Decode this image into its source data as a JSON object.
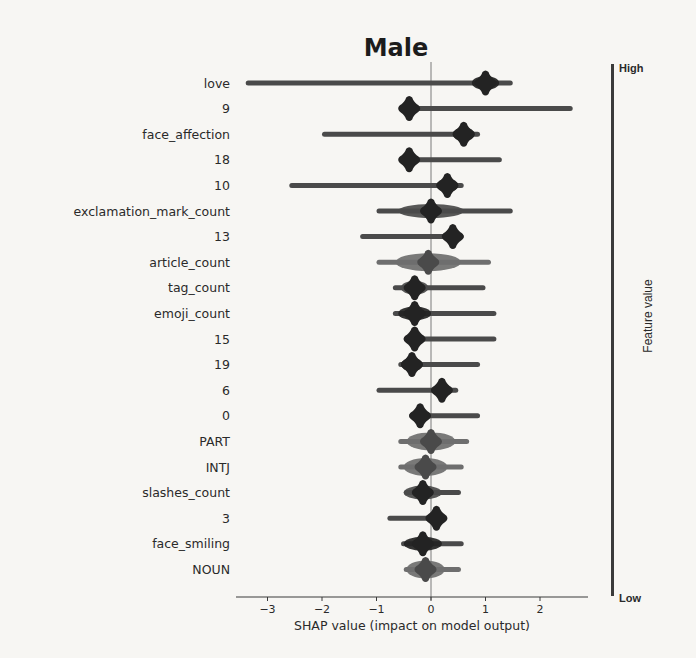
{
  "chart_data": {
    "type": "scatter",
    "subtype": "shap_beeswarm_summary",
    "title": "Male",
    "xlabel": "SHAP value (impact on model output)",
    "ylabel": "",
    "xlim": [
      -3.6,
      2.9
    ],
    "xticks": [
      -3,
      -2,
      -1,
      0,
      1,
      2
    ],
    "xtick_labels": [
      "−3",
      "−2",
      "−1",
      "0",
      "1",
      "2"
    ],
    "grid": false,
    "zero_line": true,
    "colorbar": {
      "title": "Feature value",
      "high_label": "High",
      "low_label": "Low",
      "position": "right"
    },
    "features": [
      {
        "name": "love",
        "min": -3.4,
        "max": 1.5,
        "center": 1.0,
        "spread": 0.25,
        "tone": "dark",
        "tail": "left"
      },
      {
        "name": "9",
        "min": -0.5,
        "max": 2.6,
        "center": -0.4,
        "spread": 0.15,
        "tone": "dark",
        "tail": "right"
      },
      {
        "name": "face_affection",
        "min": -2.0,
        "max": 0.9,
        "center": 0.6,
        "spread": 0.2,
        "tone": "dark",
        "tail": "left"
      },
      {
        "name": "18",
        "min": -0.5,
        "max": 1.3,
        "center": -0.4,
        "spread": 0.15,
        "tone": "dark",
        "tail": "right"
      },
      {
        "name": "10",
        "min": -2.6,
        "max": 0.6,
        "center": 0.3,
        "spread": 0.2,
        "tone": "dark",
        "tail": "left"
      },
      {
        "name": "exclamation_mark_count",
        "min": -1.0,
        "max": 1.5,
        "center": 0.0,
        "spread": 0.6,
        "tone": "mixed",
        "tail": "both"
      },
      {
        "name": "13",
        "min": -1.3,
        "max": 0.6,
        "center": 0.4,
        "spread": 0.12,
        "tone": "dark",
        "tail": "left"
      },
      {
        "name": "article_count",
        "min": -1.0,
        "max": 1.1,
        "center": -0.05,
        "spread": 0.6,
        "tone": "grey",
        "tail": "both"
      },
      {
        "name": "tag_count",
        "min": -0.7,
        "max": 1.0,
        "center": -0.3,
        "spread": 0.25,
        "tone": "mixed",
        "tail": "right"
      },
      {
        "name": "emoji_count",
        "min": -0.7,
        "max": 1.2,
        "center": -0.3,
        "spread": 0.3,
        "tone": "dark",
        "tail": "right"
      },
      {
        "name": "15",
        "min": -0.5,
        "max": 1.2,
        "center": -0.3,
        "spread": 0.12,
        "tone": "dark",
        "tail": "right"
      },
      {
        "name": "19",
        "min": -0.6,
        "max": 0.9,
        "center": -0.35,
        "spread": 0.2,
        "tone": "dark",
        "tail": "right"
      },
      {
        "name": "6",
        "min": -1.0,
        "max": 0.5,
        "center": 0.2,
        "spread": 0.15,
        "tone": "dark",
        "tail": "left"
      },
      {
        "name": "0",
        "min": -0.4,
        "max": 0.9,
        "center": -0.2,
        "spread": 0.1,
        "tone": "dark",
        "tail": "right"
      },
      {
        "name": "PART",
        "min": -0.6,
        "max": 0.7,
        "center": 0.0,
        "spread": 0.45,
        "tone": "grey",
        "tail": "both"
      },
      {
        "name": "INTJ",
        "min": -0.6,
        "max": 0.6,
        "center": -0.1,
        "spread": 0.4,
        "tone": "grey",
        "tail": "both"
      },
      {
        "name": "slashes_count",
        "min": -0.5,
        "max": 0.55,
        "center": -0.15,
        "spread": 0.35,
        "tone": "mixed",
        "tail": "both"
      },
      {
        "name": "3",
        "min": -0.8,
        "max": 0.25,
        "center": 0.1,
        "spread": 0.08,
        "tone": "dark",
        "tail": "left"
      },
      {
        "name": "face_smiling",
        "min": -0.55,
        "max": 0.6,
        "center": -0.15,
        "spread": 0.35,
        "tone": "dark",
        "tail": "both"
      },
      {
        "name": "NOUN",
        "min": -0.5,
        "max": 0.55,
        "center": -0.1,
        "spread": 0.35,
        "tone": "grey",
        "tail": "both"
      }
    ]
  },
  "colors": {
    "background": "#f7f6f3",
    "dark_tone": "#232323",
    "mid_tone": "#4a4a4a",
    "grey_tone": "#6e6e6e",
    "axis": "#3a3a3a",
    "zero_line": "#7a7a7a",
    "colorbar": "#3a3a3a"
  }
}
